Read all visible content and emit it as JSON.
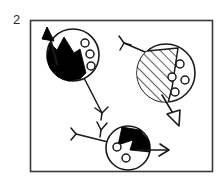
{
  "figure": {
    "label": "2",
    "frame": {
      "x": 30,
      "y": 20,
      "width": 183,
      "height": 152,
      "stroke_color": "#3a3a3a",
      "fill_color": "#ffffff"
    },
    "colors": {
      "ink": "#1a1a1a",
      "fill_black": "#000000",
      "fill_white": "#ffffff",
      "background": "#ffffff",
      "frame": "#3a3a3a"
    },
    "objects": [
      {
        "name": "cell-top-left",
        "circle": {
          "cx": 73,
          "cy": 55,
          "r": 26
        },
        "region_fill": "black",
        "inclusion_count": 3,
        "inclusions": [
          {
            "cx": 85,
            "cy": 43,
            "r": 4
          },
          {
            "cx": 90,
            "cy": 54,
            "r": 4
          },
          {
            "cx": 91,
            "cy": 66,
            "r": 4
          }
        ],
        "arrow": {
          "type": "solid-triangle",
          "direction": "up-left",
          "tip_x": 47,
          "tip_y": 29
        },
        "tail": {
          "type": "y-fork",
          "direction": "down-right",
          "end_x": 102,
          "end_y": 115
        }
      },
      {
        "name": "cell-top-right",
        "circle": {
          "cx": 166,
          "cy": 73,
          "r": 29
        },
        "region_fill": "hatched",
        "hatch_angle_deg": 45,
        "inclusion_count": 4,
        "inclusions": [
          {
            "cx": 180,
            "cy": 64,
            "r": 4
          },
          {
            "cx": 172,
            "cy": 77,
            "r": 4
          },
          {
            "cx": 185,
            "cy": 80,
            "r": 4
          },
          {
            "cx": 175,
            "cy": 92,
            "r": 4
          }
        ],
        "arrow": {
          "type": "hollow-triangle",
          "direction": "down-right",
          "tip_x": 178,
          "tip_y": 124
        },
        "tail": {
          "type": "y-fork",
          "direction": "up-left",
          "end_x": 120,
          "end_y": 42
        }
      },
      {
        "name": "cell-bottom-center",
        "circle": {
          "cx": 128,
          "cy": 148,
          "r": 22
        },
        "region_fill": "black",
        "inclusion_count": 2,
        "inclusions": [
          {
            "cx": 117,
            "cy": 147,
            "r": 4
          },
          {
            "cx": 126,
            "cy": 158,
            "r": 4
          }
        ],
        "arrow": {
          "type": "open-vee",
          "direction": "right",
          "tip_x": 166,
          "tip_y": 150
        },
        "tail": {
          "type": "y-fork",
          "direction": "left",
          "end_x": 70,
          "end_y": 136
        }
      }
    ]
  }
}
